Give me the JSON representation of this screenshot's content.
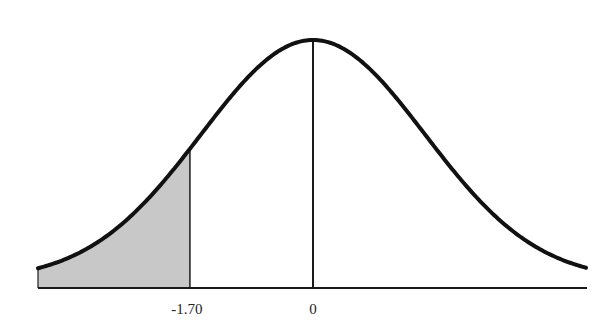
{
  "chart_data": {
    "type": "area",
    "title": "",
    "xlabel": "",
    "ylabel": "",
    "distribution": {
      "name": "standard normal",
      "mean": 0,
      "sd": 1
    },
    "x_range": [
      -3.8,
      3.8
    ],
    "tick_labels": [
      {
        "value": -1.7,
        "label": "-1.70"
      },
      {
        "value": 0,
        "label": "0"
      }
    ],
    "shaded_region": {
      "from": "-inf",
      "to": -1.7,
      "tail": "left"
    },
    "reference_lines": [
      {
        "x": 0,
        "label": "0"
      },
      {
        "x": -1.7,
        "label": "-1.70"
      }
    ],
    "grid": false,
    "legend": null
  },
  "colors": {
    "curve": "#111111",
    "shade": "#c8c8c8",
    "axis": "#1a1a1a"
  },
  "labels": {
    "cutoff": "-1.70",
    "mean": "0"
  }
}
